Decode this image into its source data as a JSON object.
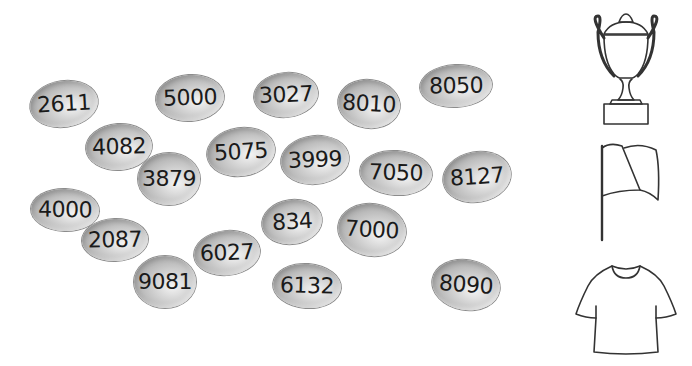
{
  "pebbles": [
    {
      "value": "2611",
      "x": 64,
      "y": 104,
      "w": 68,
      "h": 46,
      "rot": -8
    },
    {
      "value": "5000",
      "x": 190,
      "y": 98,
      "w": 68,
      "h": 46,
      "rot": -4
    },
    {
      "value": "3027",
      "x": 286,
      "y": 95,
      "w": 64,
      "h": 44,
      "rot": -6
    },
    {
      "value": "8010",
      "x": 369,
      "y": 104,
      "w": 62,
      "h": 48,
      "rot": 8
    },
    {
      "value": "8050",
      "x": 456,
      "y": 86,
      "w": 72,
      "h": 42,
      "rot": -3
    },
    {
      "value": "4082",
      "x": 119,
      "y": 147,
      "w": 66,
      "h": 46,
      "rot": -4
    },
    {
      "value": "5075",
      "x": 241,
      "y": 152,
      "w": 68,
      "h": 48,
      "rot": -8
    },
    {
      "value": "3879",
      "x": 169,
      "y": 179,
      "w": 62,
      "h": 52,
      "rot": 0
    },
    {
      "value": "3999",
      "x": 315,
      "y": 160,
      "w": 68,
      "h": 48,
      "rot": -6
    },
    {
      "value": "7050",
      "x": 396,
      "y": 173,
      "w": 72,
      "h": 44,
      "rot": 4
    },
    {
      "value": "8127",
      "x": 477,
      "y": 177,
      "w": 68,
      "h": 50,
      "rot": -10
    },
    {
      "value": "4000",
      "x": 65,
      "y": 210,
      "w": 68,
      "h": 42,
      "rot": 2
    },
    {
      "value": "2087",
      "x": 115,
      "y": 240,
      "w": 66,
      "h": 42,
      "rot": -2
    },
    {
      "value": "834",
      "x": 292,
      "y": 222,
      "w": 60,
      "h": 44,
      "rot": -8
    },
    {
      "value": "7000",
      "x": 372,
      "y": 230,
      "w": 68,
      "h": 52,
      "rot": 8
    },
    {
      "value": "6027",
      "x": 227,
      "y": 253,
      "w": 66,
      "h": 44,
      "rot": -6
    },
    {
      "value": "9081",
      "x": 165,
      "y": 282,
      "w": 62,
      "h": 52,
      "rot": 0
    },
    {
      "value": "6132",
      "x": 307,
      "y": 286,
      "w": 68,
      "h": 44,
      "rot": 4
    },
    {
      "value": "8090",
      "x": 466,
      "y": 285,
      "w": 68,
      "h": 50,
      "rot": 10
    }
  ],
  "icons": [
    {
      "name": "trophy-icon",
      "top": 4,
      "height": 126
    },
    {
      "name": "flag-icon",
      "top": 138,
      "height": 108
    },
    {
      "name": "tshirt-icon",
      "top": 252,
      "height": 106
    }
  ],
  "colors": {
    "background": "#ffffff",
    "pebble_dark": "#979797",
    "pebble_light": "#f4f4f4",
    "text": "#1a1a1a",
    "line_art": "#333333"
  }
}
